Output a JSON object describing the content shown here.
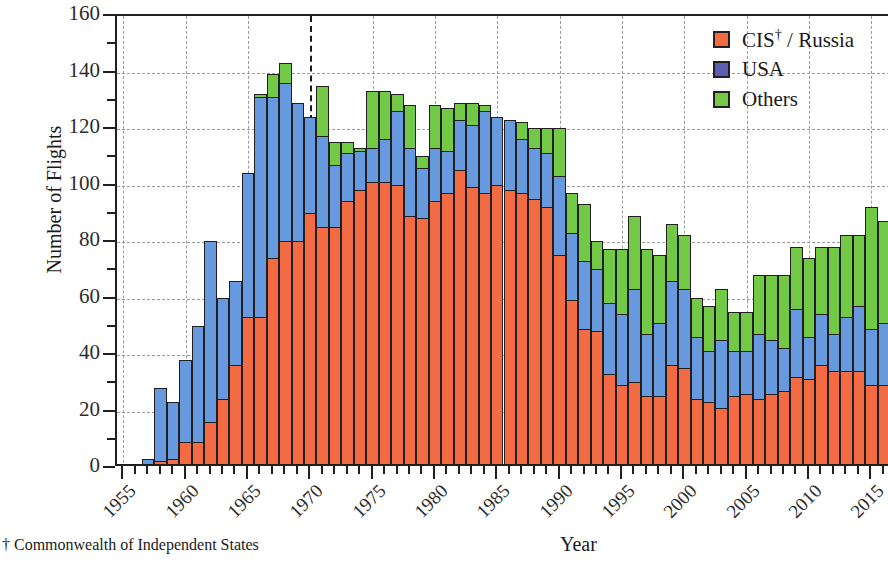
{
  "chart_data": {
    "type": "bar",
    "stacked": true,
    "title": "",
    "xlabel": "Year",
    "ylabel": "Number of Flights",
    "ylim": [
      0,
      160
    ],
    "ytick_step": 20,
    "yticks": [
      0,
      20,
      40,
      60,
      80,
      100,
      120,
      140,
      160
    ],
    "xlim": [
      1954.5,
      2016.5
    ],
    "xticks": [
      1955,
      1960,
      1965,
      1970,
      1975,
      1980,
      1985,
      1990,
      1995,
      2000,
      2005,
      2010,
      2015
    ],
    "xtick_labels": [
      "1955",
      "1960",
      "1965",
      "1970",
      "1975",
      "1980",
      "1985",
      "1990",
      "1995",
      "2000",
      "2005",
      "2010",
      "2015"
    ],
    "grid": true,
    "grid_style": "dashed",
    "legend_position": "top-right",
    "annotation_line_x": 1970,
    "footnote": "† Commonwealth of Independent States",
    "colors": {
      "cis": "#f26b42",
      "usa": "#6699dd",
      "others": "#72c945",
      "legend_usa": "#5b5fb0",
      "outline": "#231f20",
      "grid": "#9b9b9b"
    },
    "legend": [
      {
        "key": "cis",
        "label": "CIS† / Russia",
        "color": "#f26b42"
      },
      {
        "key": "usa",
        "label": "USA",
        "color": "#5b5fb0"
      },
      {
        "key": "others",
        "label": "Others",
        "color": "#72c945"
      }
    ],
    "categories": [
      1957,
      1958,
      1959,
      1960,
      1961,
      1962,
      1963,
      1964,
      1965,
      1966,
      1967,
      1968,
      1969,
      1970,
      1971,
      1972,
      1973,
      1974,
      1975,
      1976,
      1977,
      1978,
      1979,
      1980,
      1981,
      1982,
      1983,
      1984,
      1985,
      1986,
      1987,
      1988,
      1989,
      1990,
      1991,
      1992,
      1993,
      1994,
      1995,
      1996,
      1997,
      1998,
      1999,
      2000,
      2001,
      2002,
      2003,
      2004,
      2005,
      2006,
      2007,
      2008,
      2009,
      2010,
      2011,
      2012,
      2013,
      2014,
      2015,
      2016
    ],
    "series": [
      {
        "name": "CIS† / Russia",
        "key": "cis",
        "values": [
          1,
          2,
          3,
          9,
          9,
          16,
          24,
          36,
          53,
          53,
          74,
          80,
          80,
          90,
          85,
          85,
          94,
          98,
          101,
          101,
          100,
          89,
          88,
          94,
          97,
          105,
          99,
          97,
          100,
          98,
          97,
          95,
          92,
          75,
          59,
          49,
          48,
          33,
          29,
          30,
          25,
          25,
          36,
          35,
          24,
          23,
          21,
          25,
          26,
          24,
          26,
          27,
          32,
          31,
          36,
          34,
          34,
          34,
          29,
          29
        ]
      },
      {
        "name": "USA",
        "key": "usa",
        "values": [
          2,
          26,
          20,
          29,
          41,
          64,
          36,
          30,
          51,
          78,
          57,
          56,
          49,
          34,
          32,
          22,
          17,
          14,
          12,
          15,
          26,
          24,
          18,
          19,
          15,
          18,
          22,
          29,
          24,
          25,
          19,
          18,
          19,
          28,
          24,
          24,
          22,
          25,
          25,
          33,
          22,
          26,
          30,
          28,
          22,
          18,
          24,
          16,
          15,
          23,
          19,
          15,
          24,
          15,
          18,
          13,
          19,
          23,
          20,
          22
        ]
      },
      {
        "name": "Others",
        "key": "others",
        "values": [
          0,
          0,
          0,
          0,
          0,
          0,
          0,
          0,
          0,
          1,
          8,
          7,
          0,
          0,
          18,
          8,
          4,
          1,
          20,
          17,
          6,
          15,
          4,
          15,
          15,
          6,
          8,
          2,
          0,
          0,
          6,
          7,
          9,
          17,
          14,
          20,
          10,
          19,
          23,
          26,
          30,
          24,
          20,
          19,
          14,
          16,
          18,
          14,
          14,
          21,
          23,
          26,
          22,
          28,
          24,
          31,
          29,
          25,
          43,
          36
        ]
      }
    ],
    "totals": [
      3,
      28,
      23,
      38,
      50,
      80,
      60,
      66,
      104,
      132,
      139,
      143,
      129,
      124,
      135,
      115,
      115,
      113,
      133,
      133,
      132,
      128,
      110,
      128,
      127,
      129,
      129,
      128,
      124,
      123,
      122,
      120,
      120,
      120,
      97,
      93,
      80,
      77,
      77,
      89,
      77,
      75,
      86,
      82,
      60,
      57,
      63,
      55,
      55,
      68,
      68,
      68,
      78,
      74,
      78,
      78,
      82,
      82,
      92,
      87
    ]
  }
}
